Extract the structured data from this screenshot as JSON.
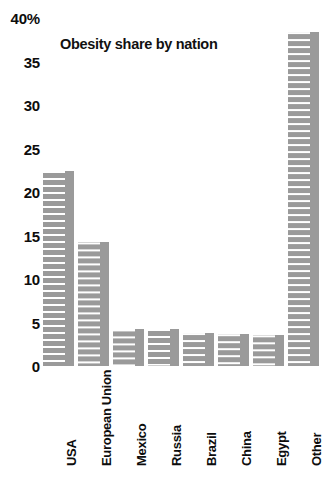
{
  "chart_data": {
    "type": "bar",
    "title": "Obesity share by nation",
    "xlabel": "",
    "ylabel": "",
    "categories": [
      "USA",
      "European Union",
      "Mexico",
      "Russia",
      "Brazil",
      "China",
      "Egypt",
      "Other"
    ],
    "values": [
      22.4,
      14.3,
      4.3,
      4.2,
      3.8,
      3.7,
      3.6,
      38.4
    ],
    "ylim": [
      0,
      40
    ],
    "yticks": [
      0,
      5,
      10,
      15,
      20,
      25,
      30,
      35,
      40
    ],
    "ytick_labels": [
      "0",
      "5",
      "10",
      "15",
      "20",
      "25",
      "30",
      "35",
      "40%"
    ],
    "grid": false,
    "legend": null,
    "series": [
      {
        "name": "Obesity share",
        "values": [
          22.4,
          14.3,
          4.3,
          4.2,
          3.8,
          3.7,
          3.6,
          38.4
        ]
      }
    ],
    "bar_color": "#9a9a9a",
    "bar_pattern": "horizontal-stripes",
    "background_color": "#ffffff",
    "text_color": "#0d0d0d"
  }
}
